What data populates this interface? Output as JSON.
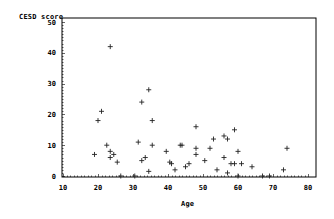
{
  "chart_data": {
    "type": "scatter",
    "title": "",
    "xlabel": "Age",
    "ylabel": "CESD score",
    "xlim": [
      10,
      80
    ],
    "ylim": [
      0,
      50
    ],
    "xticks": [
      10,
      20,
      30,
      40,
      50,
      60,
      70,
      80
    ],
    "yticks": [
      0,
      10,
      20,
      30,
      40,
      50
    ],
    "grid": false,
    "legend": null,
    "marker": "+",
    "series": [
      {
        "name": "CESD score vs Age",
        "points": [
          [
            23.5,
            42
          ],
          [
            21,
            21
          ],
          [
            20,
            18
          ],
          [
            22.5,
            10
          ],
          [
            19,
            7
          ],
          [
            23.5,
            8
          ],
          [
            24.5,
            7
          ],
          [
            23.5,
            6
          ],
          [
            25.5,
            4.5
          ],
          [
            26.5,
            0
          ],
          [
            30.5,
            0
          ],
          [
            31.5,
            11
          ],
          [
            34.5,
            28
          ],
          [
            32.5,
            24
          ],
          [
            35.5,
            18
          ],
          [
            35.5,
            10
          ],
          [
            43.5,
            10
          ],
          [
            39.5,
            8
          ],
          [
            33.5,
            6
          ],
          [
            32.5,
            5
          ],
          [
            40.5,
            4.5
          ],
          [
            42,
            2
          ],
          [
            34.5,
            1.5
          ],
          [
            48,
            16
          ],
          [
            59,
            15
          ],
          [
            56,
            13
          ],
          [
            57,
            12
          ],
          [
            53,
            12
          ],
          [
            44,
            10
          ],
          [
            48,
            9
          ],
          [
            52,
            9
          ],
          [
            60,
            8
          ],
          [
            48,
            7
          ],
          [
            56,
            6
          ],
          [
            50.5,
            5
          ],
          [
            46,
            4
          ],
          [
            41,
            4
          ],
          [
            45,
            3
          ],
          [
            58,
            4
          ],
          [
            59,
            4
          ],
          [
            61,
            4
          ],
          [
            54,
            2
          ],
          [
            57,
            1
          ],
          [
            60,
            0
          ],
          [
            74,
            9
          ],
          [
            64,
            3
          ],
          [
            73,
            2
          ],
          [
            67,
            0
          ],
          [
            69,
            0
          ]
        ]
      }
    ]
  },
  "labels": {
    "y_axis_title": "CESD score",
    "x_axis_title": "Age"
  }
}
